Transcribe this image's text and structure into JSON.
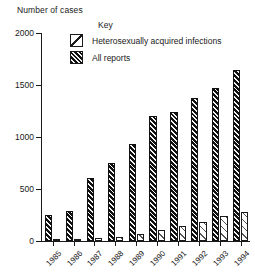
{
  "axis_title": "Number of cases",
  "legend": {
    "title": "Key",
    "items": [
      {
        "label": "Heterosexually acquired infections",
        "swatch": "hatch-light-single-diagonal"
      },
      {
        "label": "All reports",
        "swatch": "hatch-dense-dark-diagonal"
      }
    ]
  },
  "chart_data": {
    "type": "bar",
    "title": "Number of cases",
    "xlabel": "",
    "ylabel": "Number of cases",
    "ylim": [
      0,
      2000
    ],
    "yticks": [
      0,
      500,
      1000,
      1500,
      2000
    ],
    "ytick_labels": [
      "0",
      "500",
      "1000",
      "1500",
      "2000"
    ],
    "grid": false,
    "legend_position": "top-center",
    "categories": [
      "1985",
      "1986",
      "1987",
      "1988",
      "1989",
      "1990",
      "1991",
      "1992",
      "1993",
      "1994"
    ],
    "series": [
      {
        "name": "All reports",
        "values": [
          250,
          290,
          605,
          750,
          930,
          1200,
          1240,
          1375,
          1470,
          1645
        ]
      },
      {
        "name": "Heterosexually acquired infections",
        "values": [
          10,
          15,
          25,
          35,
          70,
          110,
          145,
          180,
          240,
          280
        ]
      }
    ]
  }
}
